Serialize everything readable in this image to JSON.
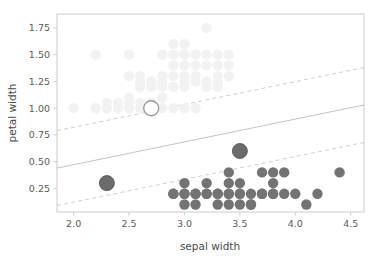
{
  "chart_data": {
    "type": "scatter",
    "title": "",
    "xlabel": "sepal width",
    "ylabel": "petal width",
    "xlim": [
      1.85,
      4.62
    ],
    "ylim": [
      0.03,
      1.88
    ],
    "xticks": [
      2.0,
      2.5,
      3.0,
      3.5,
      4.0,
      4.5
    ],
    "xticklabels": [
      "2.0",
      "2.5",
      "3.0",
      "3.5",
      "4.0",
      "4.5"
    ],
    "yticks": [
      0.25,
      0.5,
      0.75,
      1.0,
      1.25,
      1.5,
      1.75
    ],
    "yticklabels": [
      "0.25",
      "0.50",
      "0.75",
      "1.00",
      "1.25",
      "1.50",
      "1.75"
    ],
    "grid": false,
    "legend": null,
    "frame_color": "#cccccc",
    "series": [
      {
        "name": "class-background-light",
        "marker": "circle",
        "color": "#f2f2f2",
        "size": 5.2,
        "points": [
          [
            2.0,
            1.0
          ],
          [
            2.2,
            1.0
          ],
          [
            2.2,
            1.0
          ],
          [
            2.3,
            1.0
          ],
          [
            2.2,
            1.5
          ],
          [
            2.5,
            1.5
          ],
          [
            2.8,
            1.5
          ],
          [
            3.0,
            1.5
          ],
          [
            2.5,
            1.1
          ],
          [
            2.4,
            1.0
          ],
          [
            2.5,
            1.0
          ],
          [
            2.6,
            1.0
          ],
          [
            2.6,
            1.2
          ],
          [
            2.7,
            1.0
          ],
          [
            2.8,
            1.0
          ],
          [
            2.8,
            1.1
          ],
          [
            2.6,
            1.25
          ],
          [
            2.7,
            1.25
          ],
          [
            2.8,
            1.2
          ],
          [
            2.9,
            1.2
          ],
          [
            2.8,
            1.3
          ],
          [
            2.9,
            1.3
          ],
          [
            3.0,
            1.3
          ],
          [
            3.1,
            1.3
          ],
          [
            2.9,
            1.4
          ],
          [
            3.0,
            1.4
          ],
          [
            3.1,
            1.4
          ],
          [
            3.2,
            1.4
          ],
          [
            2.9,
            1.5
          ],
          [
            3.0,
            1.5
          ],
          [
            3.1,
            1.5
          ],
          [
            3.2,
            1.5
          ],
          [
            3.0,
            1.25
          ],
          [
            3.1,
            1.25
          ],
          [
            3.2,
            1.25
          ],
          [
            3.3,
            1.25
          ],
          [
            3.0,
            1.2
          ],
          [
            3.2,
            1.2
          ],
          [
            3.3,
            1.2
          ],
          [
            3.0,
            1.6
          ],
          [
            2.9,
            1.6
          ],
          [
            3.2,
            1.75
          ],
          [
            3.3,
            1.5
          ],
          [
            3.4,
            1.5
          ],
          [
            3.3,
            1.4
          ],
          [
            3.4,
            1.4
          ],
          [
            3.3,
            1.3
          ],
          [
            3.4,
            1.3
          ],
          [
            2.4,
            1.05
          ],
          [
            2.3,
            1.05
          ],
          [
            2.5,
            1.05
          ],
          [
            2.6,
            1.05
          ],
          [
            2.7,
            1.05
          ],
          [
            2.9,
            1.0
          ],
          [
            3.0,
            1.0
          ],
          [
            3.1,
            1.0
          ],
          [
            2.5,
            1.3
          ],
          [
            2.6,
            1.3
          ],
          [
            2.7,
            1.2
          ],
          [
            2.8,
            1.25
          ]
        ]
      },
      {
        "name": "class-foreground-dark",
        "marker": "circle",
        "color": "#737373",
        "size": 5.2,
        "points": [
          [
            2.9,
            0.2
          ],
          [
            3.0,
            0.2
          ],
          [
            3.0,
            0.3
          ],
          [
            3.0,
            0.1
          ],
          [
            3.1,
            0.2
          ],
          [
            3.1,
            0.1
          ],
          [
            3.2,
            0.2
          ],
          [
            3.2,
            0.2
          ],
          [
            3.3,
            0.2
          ],
          [
            3.4,
            0.2
          ],
          [
            3.4,
            0.3
          ],
          [
            3.4,
            0.1
          ],
          [
            3.4,
            0.4
          ],
          [
            3.5,
            0.2
          ],
          [
            3.5,
            0.3
          ],
          [
            3.5,
            0.1
          ],
          [
            3.6,
            0.2
          ],
          [
            3.6,
            0.1
          ],
          [
            3.7,
            0.2
          ],
          [
            3.7,
            0.4
          ],
          [
            3.8,
            0.2
          ],
          [
            3.8,
            0.3
          ],
          [
            3.8,
            0.4
          ],
          [
            3.9,
            0.4
          ],
          [
            3.8,
            0.2
          ],
          [
            3.9,
            0.2
          ],
          [
            4.0,
            0.2
          ],
          [
            4.1,
            0.1
          ],
          [
            4.2,
            0.2
          ],
          [
            4.4,
            0.4
          ],
          [
            3.3,
            0.2
          ],
          [
            3.2,
            0.3
          ],
          [
            3.0,
            0.2
          ],
          [
            3.1,
            0.2
          ],
          [
            2.9,
            0.2
          ],
          [
            3.3,
            0.1
          ],
          [
            3.6,
            0.1
          ],
          [
            3.5,
            0.2
          ],
          [
            3.4,
            0.2
          ],
          [
            3.7,
            0.2
          ]
        ]
      },
      {
        "name": "support-vectors-highlighted",
        "marker": "circle-large",
        "color": "#6b6b6b",
        "size": 7.5,
        "points": [
          [
            2.3,
            0.3
          ],
          [
            3.5,
            0.6
          ]
        ]
      },
      {
        "name": "support-vector-open",
        "marker": "circle-open",
        "color": "#9a9a9a",
        "size": 7.5,
        "points": [
          [
            2.7,
            1.0
          ]
        ]
      }
    ],
    "lines": [
      {
        "name": "decision-boundary",
        "style": "solid",
        "color": "#c4c4c4",
        "x": [
          1.85,
          4.62
        ],
        "y": [
          0.44,
          1.03
        ]
      },
      {
        "name": "margin-upper",
        "style": "dashed",
        "color": "#cfcfcf",
        "x": [
          1.85,
          4.62
        ],
        "y": [
          0.79,
          1.38
        ]
      },
      {
        "name": "margin-lower",
        "style": "dashed",
        "color": "#cfcfcf",
        "x": [
          1.85,
          4.62
        ],
        "y": [
          0.09,
          0.68
        ]
      }
    ]
  }
}
